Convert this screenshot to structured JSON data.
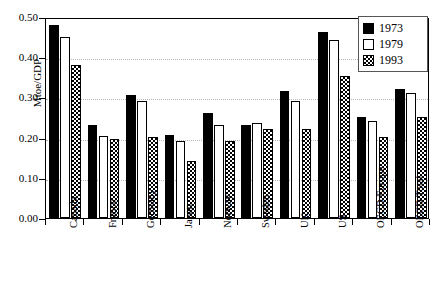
{
  "chart_data": {
    "type": "bar",
    "title": "",
    "xlabel": "",
    "ylabel": "Mtoe/GDP",
    "ylim": [
      0.0,
      0.5
    ],
    "ytick_labels": [
      "0.50",
      "0.40",
      "0.30",
      "0.20",
      "0.10",
      "0.00"
    ],
    "ytick_values": [
      0.5,
      0.4,
      0.3,
      0.2,
      0.1,
      0.0
    ],
    "grid": true,
    "grid_style": "dotted-horizontal",
    "legend_position": "top-right",
    "categories": [
      "Canada",
      "France",
      "Germany",
      "Japan",
      "Norway",
      "Sweden",
      "UK",
      "US",
      "OECD Europe",
      "OECD Total"
    ],
    "series": [
      {
        "name": "1973",
        "fill": "solid-black",
        "color": "#000000",
        "values": [
          0.481,
          0.231,
          0.307,
          0.206,
          0.262,
          0.231,
          0.317,
          0.462,
          0.252,
          0.322
        ]
      },
      {
        "name": "1979",
        "fill": "white-outline",
        "color": "#ffffff",
        "values": [
          0.45,
          0.205,
          0.292,
          0.191,
          0.232,
          0.236,
          0.292,
          0.442,
          0.242,
          0.312
        ]
      },
      {
        "name": "1993",
        "fill": "checkerboard",
        "color": "#000000",
        "values": [
          0.381,
          0.197,
          0.201,
          0.142,
          0.192,
          0.222,
          0.222,
          0.353,
          0.201,
          0.252
        ]
      }
    ]
  },
  "legend": {
    "entries": [
      {
        "label": "1973"
      },
      {
        "label": "1979"
      },
      {
        "label": "1993"
      }
    ]
  },
  "axes": {
    "y_axis_title": "Mtoe/GDP"
  }
}
